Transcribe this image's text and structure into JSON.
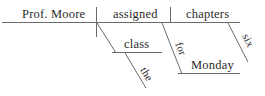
{
  "diagram": {
    "type": "reed-kellogg-sentence-diagram",
    "sentence": "Prof. Moore assigned the class six chapters for Monday.",
    "ink_color": "#6b6b6b",
    "text_color": "#2b2b2b",
    "background_color": "#ffffff",
    "nodes": {
      "subject": {
        "label": "Prof. Moore",
        "role": "subject",
        "orientation": "horizontal"
      },
      "verb": {
        "label": "assigned",
        "role": "verb",
        "orientation": "horizontal"
      },
      "direct_object": {
        "label": "chapters",
        "role": "direct-object",
        "orientation": "horizontal"
      },
      "indirect_object": {
        "label": "class",
        "role": "indirect-object",
        "orientation": "horizontal"
      },
      "article_the": {
        "label": "the",
        "role": "article-modifier",
        "orientation": "slanted"
      },
      "adjective_six": {
        "label": "six",
        "role": "adjective-modifier",
        "orientation": "slanted"
      },
      "preposition_for": {
        "label": "for",
        "role": "preposition",
        "orientation": "slanted"
      },
      "object_of_preposition": {
        "label": "Monday",
        "role": "object-of-preposition",
        "orientation": "horizontal"
      }
    }
  }
}
